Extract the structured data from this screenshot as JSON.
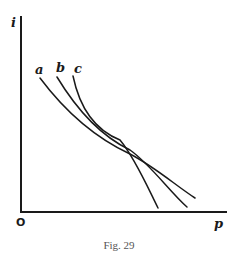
{
  "figure": {
    "caption": "Fig. 29",
    "axes": {
      "y_label": "i",
      "x_label": "p",
      "origin_label": "O"
    },
    "curves": [
      {
        "label": "a",
        "description": "downward-sloping curve, shallowest of the three"
      },
      {
        "label": "b",
        "description": "downward-sloping curve, intermediate slope"
      },
      {
        "label": "c",
        "description": "downward-sloping curve, steepest of the three"
      }
    ],
    "note": "Three curves a, b, c decline from upper left and intersect near a common point, then diverge at lower right; c ends lowest-left, a ends highest-right."
  }
}
